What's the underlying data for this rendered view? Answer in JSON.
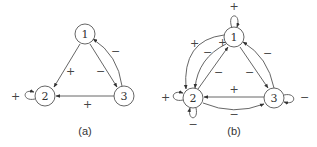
{
  "figure": {
    "panels": [
      {
        "id": "a",
        "caption": "(a)",
        "nodes": [
          {
            "id": "1",
            "label": "1"
          },
          {
            "id": "2",
            "label": "2"
          },
          {
            "id": "3",
            "label": "3"
          }
        ],
        "edges": [
          {
            "from": "1",
            "to": "2",
            "sign": "+"
          },
          {
            "from": "1",
            "to": "3",
            "sign": "−"
          },
          {
            "from": "3",
            "to": "1",
            "sign": "−"
          },
          {
            "from": "3",
            "to": "2",
            "sign": "+"
          },
          {
            "from": "2",
            "to": "2",
            "sign": "+"
          }
        ]
      },
      {
        "id": "b",
        "caption": "(b)",
        "nodes": [
          {
            "id": "1",
            "label": "1"
          },
          {
            "id": "2",
            "label": "2"
          },
          {
            "id": "3",
            "label": "3"
          }
        ],
        "edges": [
          {
            "from": "1",
            "to": "1",
            "sign": "+"
          },
          {
            "from": "1",
            "to": "2",
            "sign": "+"
          },
          {
            "from": "1",
            "to": "2",
            "sign": "−"
          },
          {
            "from": "2",
            "to": "1",
            "sign": "−"
          },
          {
            "from": "1",
            "to": "3",
            "sign": "−"
          },
          {
            "from": "3",
            "to": "1",
            "sign": "−"
          },
          {
            "from": "3",
            "to": "2",
            "sign": "+"
          },
          {
            "from": "2",
            "to": "3",
            "sign": "−"
          },
          {
            "from": "2",
            "to": "2",
            "sign": "+"
          },
          {
            "from": "2",
            "to": "2",
            "sign": "−"
          },
          {
            "from": "3",
            "to": "3",
            "sign": "−"
          }
        ]
      }
    ]
  }
}
